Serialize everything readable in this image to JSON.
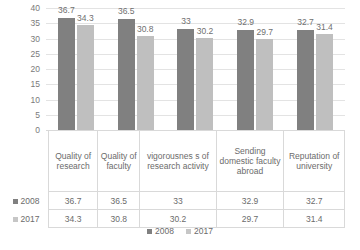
{
  "chart_data": {
    "type": "bar",
    "title": "",
    "xlabel": "",
    "ylabel": "",
    "ylim": [
      0,
      40
    ],
    "ytick_step": 5,
    "yticks": [
      "40",
      "35",
      "30",
      "25",
      "20",
      "15",
      "10",
      "5",
      "0"
    ],
    "grid": true,
    "legend_position": "bottom",
    "categories": [
      "Quality of research",
      "Quality of faculty",
      "vigorousness of research activity",
      "Sending domestic faculty abroad",
      "Reputation of university"
    ],
    "series": [
      {
        "name": "2008",
        "color": "#808080",
        "values": [
          36.7,
          36.5,
          33,
          32.9,
          32.7
        ],
        "labels": [
          "36.7",
          "36.5",
          "33",
          "32.9",
          "32.7"
        ]
      },
      {
        "name": "2017",
        "color": "#bfbfbf",
        "values": [
          34.3,
          30.8,
          30.2,
          29.7,
          31.4
        ],
        "labels": [
          "34.3",
          "30.8",
          "30.2",
          "29.7",
          "31.4"
        ]
      }
    ]
  },
  "data_table": {
    "row_headers": [
      "2008",
      "2017"
    ],
    "category_cells": [
      "Quality of research",
      "Quality of faculty",
      "vigorousnes s of research activity",
      "Sending domestic faculty abroad",
      "Reputation of university"
    ],
    "rows": [
      {
        "label": "2008",
        "values": [
          "36.7",
          "36.5",
          "33",
          "32.9",
          "32.7"
        ]
      },
      {
        "label": "2017",
        "values": [
          "34.3",
          "30.8",
          "30.2",
          "29.7",
          "31.4"
        ]
      }
    ]
  },
  "legend": {
    "items": [
      {
        "label": "2008",
        "color": "#808080"
      },
      {
        "label": "2017",
        "color": "#c6c6c6"
      }
    ]
  }
}
